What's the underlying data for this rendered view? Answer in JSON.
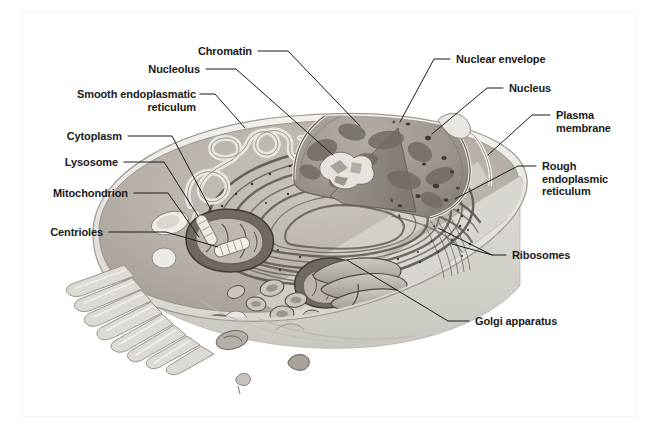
{
  "figure": {
    "style": "grayscale scientific illustration with leader-line callouts",
    "background_color": "#ffffff",
    "frame_color": "#f4f4f5",
    "label_color": "#1a1a1a",
    "leader_color": "#1a1a1a"
  },
  "labels": [
    {
      "id": "chromatin",
      "text": "Chromatin",
      "side": "left",
      "x": 252,
      "y": 45,
      "align": "right",
      "leader": "M 258 51 L 288 51 L 360 126"
    },
    {
      "id": "nucleolus",
      "text": "Nucleolus",
      "side": "left",
      "x": 200,
      "y": 63,
      "align": "right",
      "leader": "M 206 69 L 236 69 L 333 155"
    },
    {
      "id": "smooth-endoplasmic-reticulum",
      "text": "Smooth endoplasmatic\nreticulum",
      "side": "left",
      "x": 196,
      "y": 88,
      "align": "right",
      "leader": "M 200 94 L 215 94 L 245 128"
    },
    {
      "id": "cytoplasm",
      "text": "Cytoplasm",
      "side": "left",
      "x": 122,
      "y": 130,
      "align": "right",
      "leader": "M 128 136 L 172 136 L 211 210"
    },
    {
      "id": "lysosome",
      "text": "Lysosome",
      "side": "left",
      "x": 118,
      "y": 156,
      "align": "right",
      "leader": "M 124 162 L 164 162 L 198 216"
    },
    {
      "id": "mitochondrion",
      "text": "Mitochondrion",
      "side": "left",
      "x": 128,
      "y": 187,
      "align": "right",
      "leader": "M 134 193 L 168 193 L 199 237"
    },
    {
      "id": "centrioles",
      "text": "Centrioles",
      "side": "left",
      "x": 103,
      "y": 226,
      "align": "right",
      "leader": "M 109 232 L 166 232 L 218 247"
    },
    {
      "id": "nuclear-envelope",
      "text": "Nuclear envelope",
      "side": "right",
      "x": 456,
      "y": 53,
      "align": "left",
      "leader": "M 450 59 L 434 59 L 400 122"
    },
    {
      "id": "nucleus",
      "text": "Nucleus",
      "side": "right",
      "x": 509,
      "y": 82,
      "align": "left",
      "leader": "M 503 88 L 487 88 L 432 134"
    },
    {
      "id": "plasma-membrane",
      "text": "Plasma\nmembrane",
      "side": "right",
      "x": 556,
      "y": 109,
      "align": "left",
      "leader": "M 550 115 L 532 115 L 488 155"
    },
    {
      "id": "rough-endoplasmic-reticulum",
      "text": "Rough\nendoplasmic\nreticulum",
      "side": "right",
      "x": 542,
      "y": 160,
      "align": "left",
      "leader": "M 536 166 L 518 166 L 455 199"
    },
    {
      "id": "ribosomes",
      "text": "Ribosomes",
      "side": "right",
      "x": 512,
      "y": 249,
      "align": "left",
      "leader": "M 506 255 L 492 255 L 438 228 M 492 255 L 452 244"
    },
    {
      "id": "golgi-apparatus",
      "text": "Golgi apparatus",
      "side": "right",
      "x": 475,
      "y": 315,
      "align": "left",
      "leader": "M 469 321 L 448 321 L 347 260"
    }
  ],
  "organelles": {
    "cell_body": "plasma membrane enclosed ovoid cut away at front-right",
    "nucleus": "large dome-shaped nucleus with wedge cut, chromatin mottling and dark nucleolus cluster",
    "rough_er": "concentric stacked cisternae studded with dark ribosome dots surrounding the nucleus",
    "smooth_er": "tubular looped network at upper-left of the cytoplasm",
    "golgi": "stacked flattened sacs and vesicles in lower-right cytoplasm",
    "mitochondria": "elongated dark-bordered organelles with cristae",
    "lysosome": "pale rounded vesicle near the left edge",
    "centrioles": "pair of short pale cylinders near cell centre",
    "microvilli": "finger-like projections along the lower-left membrane",
    "free_ribosomes": "scattered dark speckles in the lower cytoplasm"
  },
  "colors": {
    "cytoplasm_light": "#cfcac4",
    "cytoplasm_mid": "#b5afa9",
    "cytoplasm_dark": "#8d8781",
    "membrane_pale": "#efece8",
    "nucleus_fill": "#a9a39c",
    "nucleus_dark": "#7d7770",
    "organelle_outline": "#4a4640",
    "cut_face": "#dedad5",
    "speckle": "#3b3834"
  }
}
